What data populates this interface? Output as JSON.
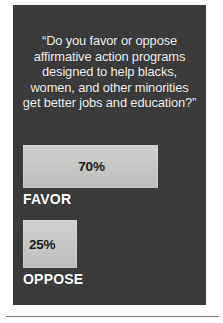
{
  "panel": {
    "background_color": "#3b3b3b",
    "question": {
      "lines": [
        "“Do you favor or oppose",
        "affirmative action programs",
        "designed to help blacks,",
        "women, and other minorities",
        "get better jobs and education?”"
      ],
      "full_text": "“Do you favor or oppose affirmative action programs designed to help blacks, women, and other minorities get better jobs and education?”",
      "text_color": "#f2f2f2"
    }
  },
  "chart_data": {
    "type": "bar",
    "title": "“Do you favor or oppose affirmative action programs designed to help blacks, women, and other minorities get better jobs and education?”",
    "xlabel": "",
    "ylabel": "",
    "orientation": "horizontal",
    "grid": false,
    "legend": false,
    "xlim": [
      0,
      100
    ],
    "categories": [
      "FAVOR",
      "OPPOSE"
    ],
    "values": [
      70,
      25
    ],
    "value_labels": [
      "70%",
      "25%"
    ],
    "bar_color": "#c9c9c7",
    "value_text_color": "#1b1b1b",
    "category_text_color": "#ffffff"
  },
  "bars": [
    {
      "label": "FAVOR",
      "value_label": "70%"
    },
    {
      "label": "OPPOSE",
      "value_label": "25%"
    }
  ]
}
